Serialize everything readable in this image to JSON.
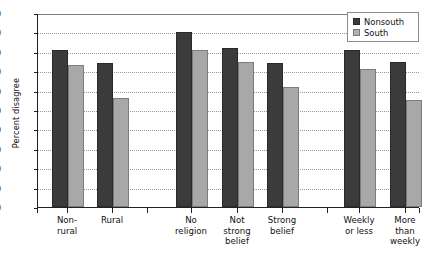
{
  "chart_data": {
    "type": "bar",
    "title": "",
    "xlabel": "",
    "ylabel": "Percent disagree",
    "ylim": [
      0,
      100
    ],
    "ytick_step": 10,
    "yticks": [
      0,
      10,
      20,
      30,
      40,
      50,
      60,
      70,
      80,
      90,
      100
    ],
    "ytick_labels": [
      "0",
      "10",
      "20",
      "30",
      "40",
      "50",
      "60",
      "70",
      "80",
      "90",
      "100"
    ],
    "grid": true,
    "legend_position": "top-right",
    "categories": [
      "Non-\nrural",
      "Rural",
      "No\nreligion",
      "Not\nstrong\nbelief",
      "Strong\nbelief",
      "Weekly\nor less",
      "More\nthan\nweekly"
    ],
    "category_labels": [
      [
        "Non-",
        "rural"
      ],
      [
        "Rural"
      ],
      [
        "No",
        "religion"
      ],
      [
        "Not",
        "strong",
        "belief"
      ],
      [
        "Strong",
        "belief"
      ],
      [
        "Weekly",
        "or less"
      ],
      [
        "More",
        "than",
        "weekly"
      ]
    ],
    "series": [
      {
        "name": "Nonsouth",
        "color": "#3b3b3b",
        "values": [
          81,
          74,
          90,
          82,
          74,
          81,
          75
        ]
      },
      {
        "name": "South",
        "color": "#a8a8a8",
        "values": [
          73,
          56,
          81,
          75,
          62,
          71,
          55
        ]
      }
    ]
  },
  "legend": {
    "items": [
      {
        "label": "Nonsouth",
        "swatch": "nonsouth"
      },
      {
        "label": "South",
        "swatch": "south"
      }
    ]
  },
  "axis": {
    "y_title": "Percent disagree"
  }
}
